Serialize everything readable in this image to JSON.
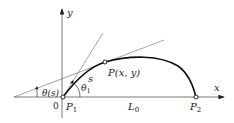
{
  "diagram": {
    "axes": {
      "x_label": "x",
      "y_label": "y",
      "origin_label": "0"
    },
    "points": {
      "p1": "P",
      "p1_sub": "1",
      "p2": "P",
      "p2_sub": "2",
      "p": "P(x, y)"
    },
    "labels": {
      "arc_length": "s",
      "theta_s": "θ(s)",
      "theta1": "θ",
      "theta1_sub": "1",
      "length": "L",
      "length_sub": "0"
    },
    "colors": {
      "line": "#555555",
      "curve": "#111111",
      "text": "#222222"
    }
  }
}
